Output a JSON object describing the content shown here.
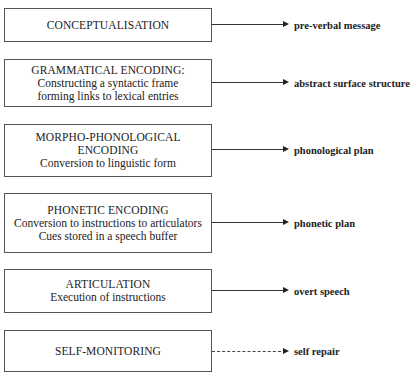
{
  "stages": [
    {
      "lines": [
        "CONCEPTUALISATION"
      ],
      "output": "pre-verbal message",
      "arrow": "solid"
    },
    {
      "lines": [
        "GRAMMATICAL ENCODING:",
        "Constructing a syntactic frame",
        "forming links to lexical entries"
      ],
      "output": "abstract surface structure",
      "arrow": "solid"
    },
    {
      "lines": [
        "MORPHO-PHONOLOGICAL",
        "ENCODING",
        "Conversion to linguistic form"
      ],
      "output": "phonological plan",
      "arrow": "solid"
    },
    {
      "lines": [
        "PHONETIC ENCODING",
        "Conversion to instructions to articulators",
        "Cues stored in a speech buffer"
      ],
      "output": "phonetic plan",
      "arrow": "solid"
    },
    {
      "lines": [
        "ARTICULATION",
        "Execution of instructions"
      ],
      "output": "overt speech",
      "arrow": "solid"
    },
    {
      "lines": [
        "SELF-MONITORING"
      ],
      "output": "self repair",
      "arrow": "dashed"
    }
  ]
}
